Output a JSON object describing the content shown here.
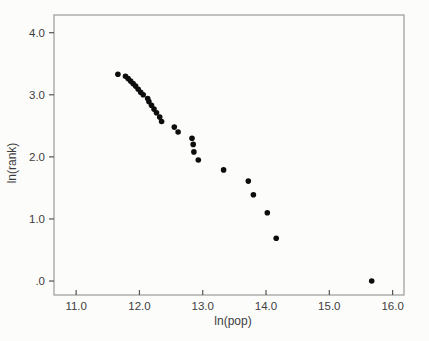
{
  "figure": {
    "kind": "scatter-plot",
    "background": "#fcfcfb"
  },
  "chart_data": {
    "type": "scatter",
    "title": "",
    "xlabel": "ln(pop)",
    "ylabel": "ln(rank)",
    "xlim": [
      10.65,
      16.18
    ],
    "ylim": [
      -0.225,
      4.285
    ],
    "grid": false,
    "legend": false,
    "x_ticks": {
      "values": [
        11,
        12,
        13,
        14,
        15,
        16
      ],
      "labels": [
        "11.0",
        "12.0",
        "13.0",
        "14.0",
        "15.0",
        "16.0"
      ]
    },
    "y_ticks": {
      "values": [
        0,
        1,
        2,
        3,
        4
      ],
      "labels": [
        ".0",
        "1.0",
        "2.0",
        "3.0",
        "4.0"
      ]
    },
    "marker": {
      "shape": "circle",
      "color": "#0d0d0d",
      "radius_px": 2.8
    },
    "frame_color": "#9a9a9a",
    "tick_color": "#555555",
    "points": [
      {
        "x": 15.67,
        "y": 0.0
      },
      {
        "x": 14.16,
        "y": 0.69
      },
      {
        "x": 14.02,
        "y": 1.1
      },
      {
        "x": 13.8,
        "y": 1.39
      },
      {
        "x": 13.72,
        "y": 1.61
      },
      {
        "x": 13.33,
        "y": 1.79
      },
      {
        "x": 12.93,
        "y": 1.95
      },
      {
        "x": 12.86,
        "y": 2.08
      },
      {
        "x": 12.85,
        "y": 2.2
      },
      {
        "x": 12.83,
        "y": 2.3
      },
      {
        "x": 12.61,
        "y": 2.4
      },
      {
        "x": 12.55,
        "y": 2.48
      },
      {
        "x": 12.35,
        "y": 2.57
      },
      {
        "x": 12.32,
        "y": 2.64
      },
      {
        "x": 12.27,
        "y": 2.71
      },
      {
        "x": 12.23,
        "y": 2.77
      },
      {
        "x": 12.19,
        "y": 2.83
      },
      {
        "x": 12.15,
        "y": 2.89
      },
      {
        "x": 12.13,
        "y": 2.94
      },
      {
        "x": 12.06,
        "y": 3.0
      },
      {
        "x": 12.02,
        "y": 3.04
      },
      {
        "x": 11.98,
        "y": 3.09
      },
      {
        "x": 11.94,
        "y": 3.14
      },
      {
        "x": 11.9,
        "y": 3.18
      },
      {
        "x": 11.86,
        "y": 3.22
      },
      {
        "x": 11.82,
        "y": 3.26
      },
      {
        "x": 11.78,
        "y": 3.3
      },
      {
        "x": 11.66,
        "y": 3.33
      }
    ]
  }
}
